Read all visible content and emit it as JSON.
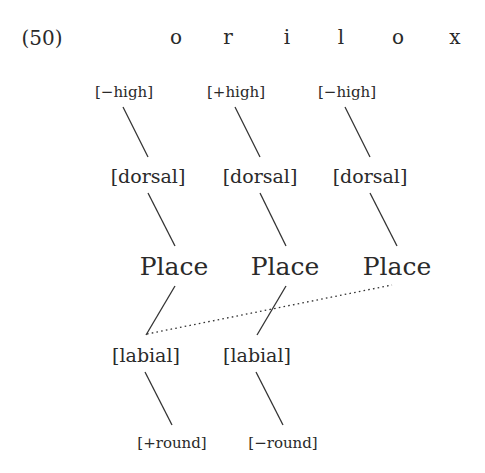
{
  "example_number": "(50)",
  "segments": [
    "o",
    "r",
    "i",
    "l",
    "o",
    "x"
  ],
  "tiers": {
    "height": [
      "[−high]",
      "[+high]",
      "[−high]"
    ],
    "dorsal": [
      "[dorsal]",
      "[dorsal]",
      "[dorsal]"
    ],
    "place": [
      "Place",
      "Place",
      "Place"
    ],
    "labial": [
      "[labial]",
      "[labial]"
    ],
    "round": [
      "[+round]",
      "[−round]"
    ]
  },
  "associations": [
    {
      "from": "height.0",
      "to": "dorsal.0",
      "style": "solid"
    },
    {
      "from": "height.1",
      "to": "dorsal.1",
      "style": "solid"
    },
    {
      "from": "height.2",
      "to": "dorsal.2",
      "style": "solid"
    },
    {
      "from": "dorsal.0",
      "to": "place.0",
      "style": "solid"
    },
    {
      "from": "dorsal.1",
      "to": "place.1",
      "style": "solid"
    },
    {
      "from": "dorsal.2",
      "to": "place.2",
      "style": "solid"
    },
    {
      "from": "place.0",
      "to": "labial.0",
      "style": "solid"
    },
    {
      "from": "place.1",
      "to": "labial.1",
      "style": "solid"
    },
    {
      "from": "place.2",
      "to": "labial.0",
      "style": "dotted"
    },
    {
      "from": "labial.0",
      "to": "round.0",
      "style": "solid"
    },
    {
      "from": "labial.1",
      "to": "round.1",
      "style": "solid"
    }
  ],
  "colors": {
    "ink": "#2a2a2a",
    "background": "#ffffff"
  }
}
